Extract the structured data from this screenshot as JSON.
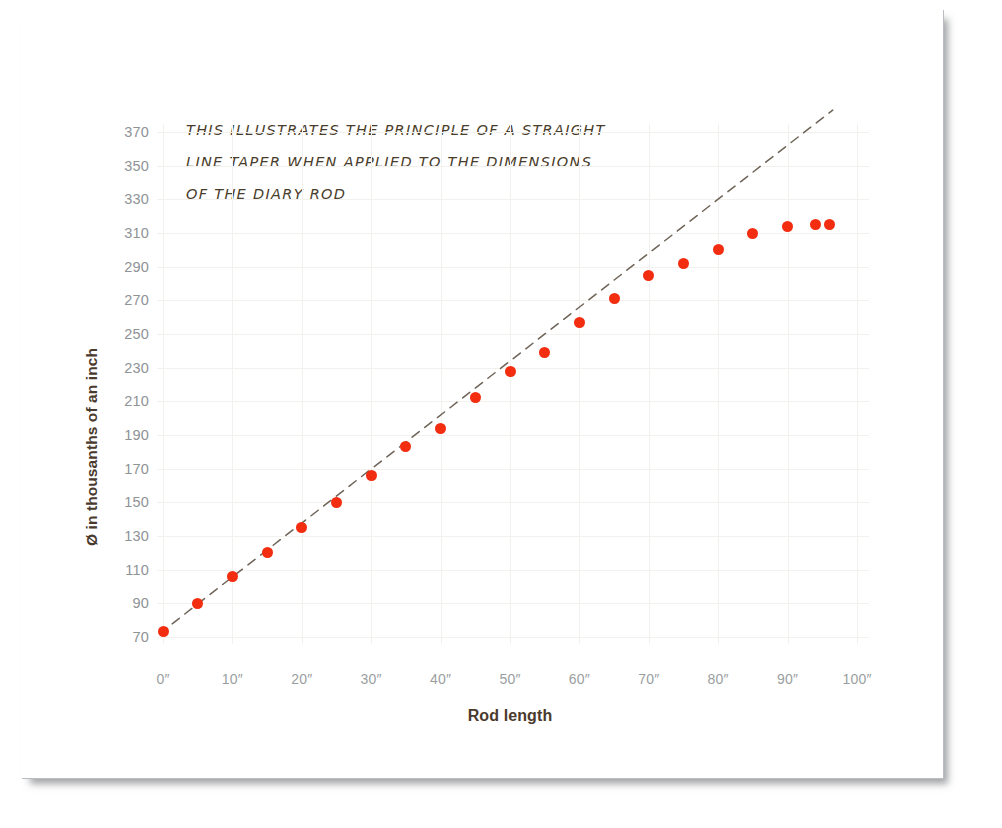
{
  "chart_data": {
    "type": "scatter",
    "title": "",
    "subtitle": "",
    "xlabel": "Rod length",
    "ylabel": "Ø in thousanths of an inch",
    "xlim": [
      0,
      100
    ],
    "ylim": [
      70,
      370
    ],
    "grid": true,
    "legend": "none",
    "xtick_labels": [
      "0″",
      "10″",
      "20″",
      "30″",
      "40″",
      "50″",
      "60″",
      "70″",
      "80″",
      "90″",
      "100″"
    ],
    "xtick_values": [
      0,
      10,
      20,
      30,
      40,
      50,
      60,
      70,
      80,
      90,
      100
    ],
    "ytick_labels": [
      "370",
      "350",
      "330",
      "310",
      "290",
      "270",
      "250",
      "230",
      "210",
      "190",
      "170",
      "150",
      "130",
      "110",
      "90",
      "70"
    ],
    "ytick_values": [
      370,
      350,
      330,
      310,
      290,
      270,
      250,
      230,
      210,
      190,
      170,
      150,
      130,
      110,
      90,
      70
    ],
    "point_color": "#f22d10",
    "trendline": {
      "style": "dashed",
      "color": "#6e6457",
      "x": [
        -0.5,
        96.5
      ],
      "y": [
        72,
        383
      ]
    },
    "series": [
      {
        "name": "Rod diameter",
        "x": [
          0,
          5,
          10,
          15,
          20,
          25,
          30,
          35,
          40,
          45,
          50,
          55,
          60,
          65,
          70,
          75,
          80,
          85,
          90,
          94,
          96
        ],
        "y": [
          73,
          90,
          106,
          120,
          135,
          150,
          166,
          183,
          194,
          212,
          228,
          239,
          257,
          271,
          285,
          292,
          300,
          310,
          314,
          315,
          315
        ]
      }
    ],
    "annotations": [
      {
        "id": "straight-line-taper-note",
        "lines": [
          "THIS ILLUSTRATES THE PRINCIPLE OF A STRAIGHT",
          "LINE TAPER WHEN APPLIED TO THE DIMENSIONS",
          "OF THE DIARY ROD"
        ]
      }
    ]
  }
}
